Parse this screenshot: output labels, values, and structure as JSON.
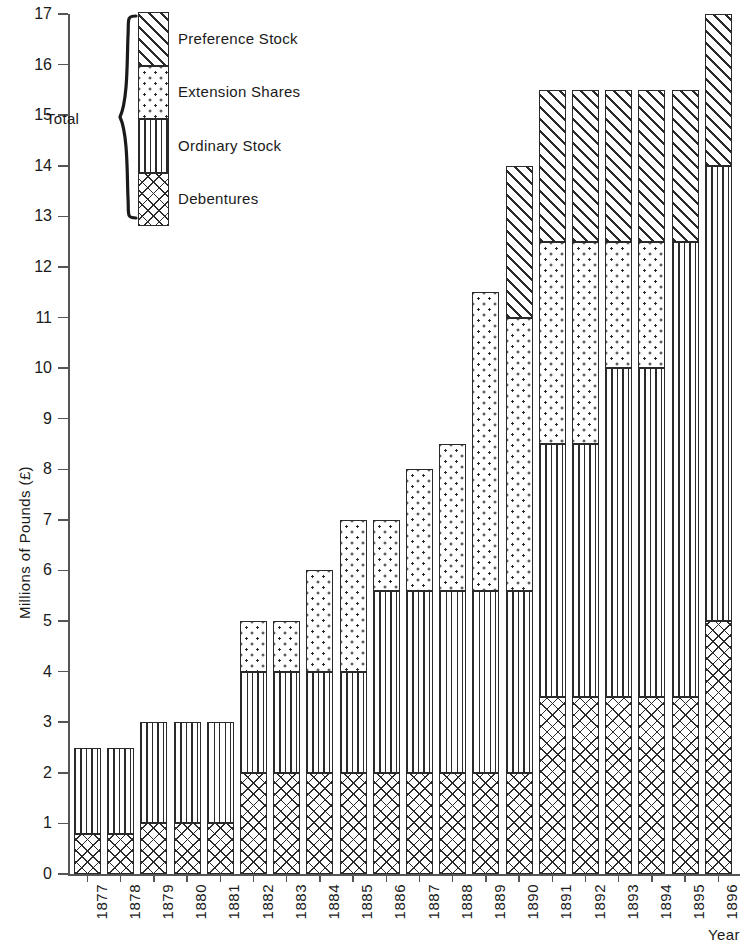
{
  "chart_data": {
    "type": "bar",
    "subtype": "stacked-bar",
    "title": "",
    "xlabel": "Year",
    "ylabel": "Millions of Pounds (£)",
    "ylim": [
      0,
      17
    ],
    "ytick_values": [
      0,
      1,
      2,
      3,
      4,
      5,
      6,
      7,
      8,
      9,
      10,
      11,
      12,
      13,
      14,
      15,
      16,
      17
    ],
    "ytick_labels": [
      "0",
      "1",
      "2",
      "3",
      "4",
      "5",
      "6",
      "7",
      "8",
      "9",
      "10",
      "11",
      "12",
      "13",
      "14",
      "15",
      "16",
      "17"
    ],
    "grid": false,
    "legend_position": "top-left-inside",
    "legend_group_label": "Total",
    "categories": [
      "1877",
      "1878",
      "1879",
      "1880",
      "1881",
      "1882",
      "1883",
      "1884",
      "1885",
      "1886",
      "1887",
      "1888",
      "1889",
      "1890",
      "1891",
      "1892",
      "1893",
      "1894",
      "1895",
      "1896"
    ],
    "series": [
      {
        "name": "Debentures",
        "pattern": "cross-hatch",
        "values": [
          0.8,
          0.8,
          1.0,
          1.0,
          1.0,
          2.0,
          2.0,
          2.0,
          2.0,
          2.0,
          2.0,
          2.0,
          2.0,
          2.0,
          3.5,
          3.5,
          3.5,
          3.5,
          3.5,
          5.0
        ]
      },
      {
        "name": "Ordinary Stock",
        "pattern": "vertical-lines",
        "values": [
          1.7,
          1.7,
          2.0,
          2.0,
          2.0,
          2.0,
          2.0,
          2.0,
          2.0,
          3.6,
          3.6,
          3.6,
          3.6,
          3.6,
          5.0,
          5.0,
          6.5,
          6.5,
          9.0,
          9.0
        ]
      },
      {
        "name": "Extension Shares",
        "pattern": "dots",
        "values": [
          0.0,
          0.0,
          0.0,
          0.0,
          0.0,
          1.0,
          1.0,
          2.0,
          3.0,
          1.4,
          2.4,
          2.9,
          5.9,
          5.4,
          4.0,
          4.0,
          2.5,
          2.5,
          0.0,
          0.0
        ]
      },
      {
        "name": "Preference Stock",
        "pattern": "diagonal-hatch",
        "values": [
          0.0,
          0.0,
          0.0,
          0.0,
          0.0,
          0.0,
          0.0,
          0.0,
          0.0,
          0.0,
          0.0,
          0.0,
          0.0,
          3.0,
          3.0,
          3.0,
          3.0,
          3.0,
          3.0,
          3.0
        ]
      }
    ],
    "cumulative_tops": {
      "1877": {
        "debentures": 0.8,
        "ordinary": 2.5,
        "extension": 2.5,
        "preference": 2.5
      },
      "1878": {
        "debentures": 0.8,
        "ordinary": 2.5,
        "extension": 2.5,
        "preference": 2.5
      },
      "1879": {
        "debentures": 1.0,
        "ordinary": 3.0,
        "extension": 3.0,
        "preference": 3.0
      },
      "1880": {
        "debentures": 1.0,
        "ordinary": 3.0,
        "extension": 3.0,
        "preference": 3.0
      },
      "1881": {
        "debentures": 1.0,
        "ordinary": 3.0,
        "extension": 3.0,
        "preference": 3.0
      },
      "1882": {
        "debentures": 2.0,
        "ordinary": 4.0,
        "extension": 5.0,
        "preference": 5.0
      },
      "1883": {
        "debentures": 2.0,
        "ordinary": 4.0,
        "extension": 5.0,
        "preference": 5.0
      },
      "1884": {
        "debentures": 2.0,
        "ordinary": 4.0,
        "extension": 6.0,
        "preference": 6.0
      },
      "1885": {
        "debentures": 2.0,
        "ordinary": 4.0,
        "extension": 7.0,
        "preference": 7.0
      },
      "1886": {
        "debentures": 2.0,
        "ordinary": 5.6,
        "extension": 7.0,
        "preference": 7.0
      },
      "1887": {
        "debentures": 2.0,
        "ordinary": 5.6,
        "extension": 8.0,
        "preference": 8.0
      },
      "1888": {
        "debentures": 2.0,
        "ordinary": 5.6,
        "extension": 8.5,
        "preference": 8.5
      },
      "1889": {
        "debentures": 2.0,
        "ordinary": 5.6,
        "extension": 11.5,
        "preference": 11.5
      },
      "1890": {
        "debentures": 2.0,
        "ordinary": 5.6,
        "extension": 11.0,
        "preference": 14.0
      },
      "1891": {
        "debentures": 3.5,
        "ordinary": 8.5,
        "extension": 12.5,
        "preference": 15.5
      },
      "1892": {
        "debentures": 3.5,
        "ordinary": 8.5,
        "extension": 12.5,
        "preference": 15.5
      },
      "1893": {
        "debentures": 3.5,
        "ordinary": 10.0,
        "extension": 12.5,
        "preference": 15.5
      },
      "1894": {
        "debentures": 3.5,
        "ordinary": 10.0,
        "extension": 12.5,
        "preference": 15.5
      },
      "1895": {
        "debentures": 3.5,
        "ordinary": 12.5,
        "extension": 12.5,
        "preference": 15.5
      },
      "1896": {
        "debentures": 5.0,
        "ordinary": 14.0,
        "extension": 14.0,
        "preference": 17.0
      }
    },
    "totals": [
      2.5,
      2.5,
      3.0,
      3.0,
      3.0,
      5.0,
      5.0,
      6.0,
      7.0,
      7.0,
      8.0,
      8.5,
      11.5,
      14.0,
      15.5,
      15.5,
      15.5,
      15.5,
      15.5,
      17.0
    ]
  },
  "legend": {
    "group_label": "Total",
    "entries": [
      {
        "label": "Preference Stock",
        "pattern": "diagonal-hatch"
      },
      {
        "label": "Extension Shares",
        "pattern": "dots"
      },
      {
        "label": "Ordinary Stock",
        "pattern": "vertical-lines"
      },
      {
        "label": "Debentures",
        "pattern": "cross-hatch"
      }
    ]
  },
  "colors": {
    "ink": "#2a2a2a",
    "axis": "#555555",
    "background": "#ffffff"
  }
}
